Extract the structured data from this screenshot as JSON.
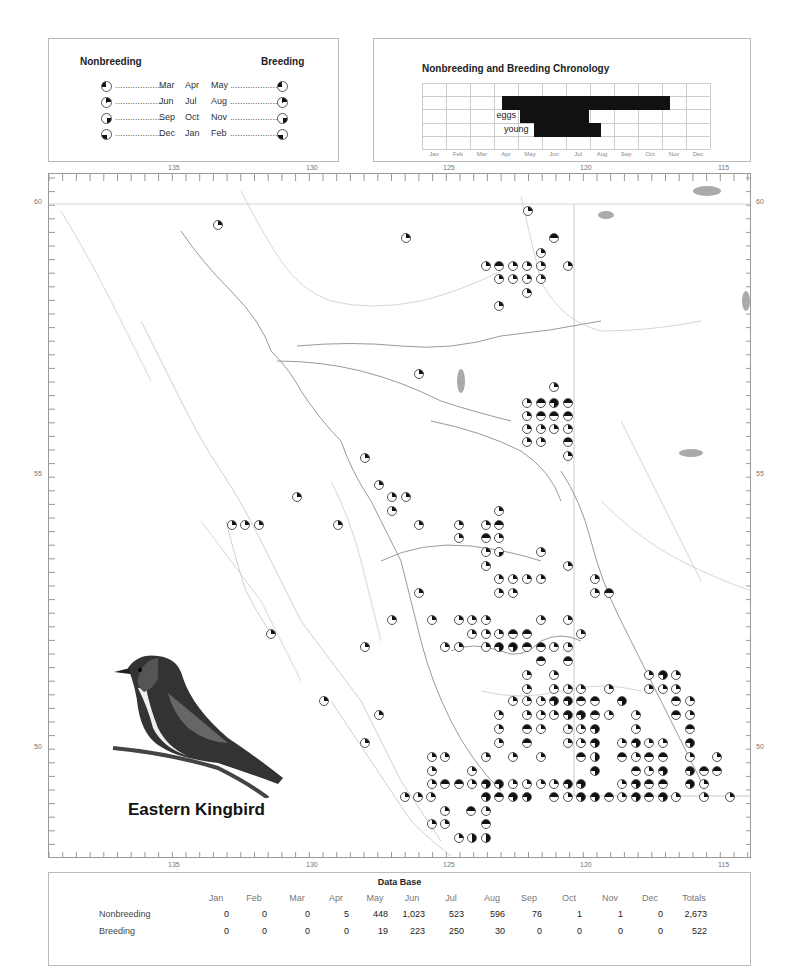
{
  "legend": {
    "nonbreeding_label": "Nonbreeding",
    "breeding_label": "Breeding",
    "rows": [
      {
        "left": "Mar",
        "mid": "Apr",
        "right": "May",
        "quarter": "q1"
      },
      {
        "left": "Jun",
        "mid": "Jul",
        "right": "Aug",
        "quarter": "q2"
      },
      {
        "left": "Sep",
        "mid": "Oct",
        "right": "Nov",
        "quarter": "q3"
      },
      {
        "left": "Dec",
        "mid": "Jan",
        "right": "Feb",
        "quarter": "q4"
      }
    ],
    "dots": "....................",
    "dots_right": "....................."
  },
  "chronology": {
    "title": "Nonbreeding and Breeding Chronology",
    "months": [
      "Jan",
      "Feb",
      "Mar",
      "Apr",
      "May",
      "Jun",
      "Jul",
      "Aug",
      "Sep",
      "Oct",
      "Nov",
      "Dec"
    ],
    "bars": [
      {
        "label": "",
        "start": 3.33,
        "end": 10.33
      },
      {
        "label": "eggs",
        "start": 4.1,
        "end": 6.95
      },
      {
        "label": "young",
        "start": 4.65,
        "end": 7.45
      }
    ]
  },
  "map": {
    "longitude_labels": [
      {
        "v": "135",
        "x": 174
      },
      {
        "v": "130",
        "x": 312
      },
      {
        "v": "125",
        "x": 449
      },
      {
        "v": "120",
        "x": 586
      },
      {
        "v": "115",
        "x": 724
      }
    ],
    "latitude_labels": [
      {
        "v": "60",
        "y": 203
      },
      {
        "v": "55",
        "y": 475
      },
      {
        "v": "50",
        "y": 748
      }
    ],
    "fill_color": "#111111",
    "symbols": [
      {
        "x": 217,
        "y": 224,
        "t": "q2"
      },
      {
        "x": 527,
        "y": 210,
        "t": "q2"
      },
      {
        "x": 405,
        "y": 237,
        "t": "q2"
      },
      {
        "x": 553,
        "y": 237,
        "t": "half"
      },
      {
        "x": 540,
        "y": 252,
        "t": "q2"
      },
      {
        "x": 485,
        "y": 265,
        "t": "q2"
      },
      {
        "x": 498,
        "y": 265,
        "t": "half"
      },
      {
        "x": 512,
        "y": 265,
        "t": "q2"
      },
      {
        "x": 526,
        "y": 265,
        "t": "q2"
      },
      {
        "x": 540,
        "y": 265,
        "t": "q2"
      },
      {
        "x": 567,
        "y": 265,
        "t": "q2"
      },
      {
        "x": 498,
        "y": 278,
        "t": "q2"
      },
      {
        "x": 512,
        "y": 278,
        "t": "q2"
      },
      {
        "x": 526,
        "y": 278,
        "t": "q2"
      },
      {
        "x": 540,
        "y": 278,
        "t": "q2"
      },
      {
        "x": 526,
        "y": 292,
        "t": "q2"
      },
      {
        "x": 498,
        "y": 305,
        "t": "q2"
      },
      {
        "x": 418,
        "y": 373,
        "t": "q2"
      },
      {
        "x": 553,
        "y": 386,
        "t": "q2"
      },
      {
        "x": 526,
        "y": 402,
        "t": "q2"
      },
      {
        "x": 540,
        "y": 402,
        "t": "half"
      },
      {
        "x": 553,
        "y": 402,
        "t": "3q"
      },
      {
        "x": 567,
        "y": 402,
        "t": "half"
      },
      {
        "x": 526,
        "y": 415,
        "t": "q2"
      },
      {
        "x": 540,
        "y": 415,
        "t": "half"
      },
      {
        "x": 553,
        "y": 415,
        "t": "half"
      },
      {
        "x": 567,
        "y": 415,
        "t": "half"
      },
      {
        "x": 526,
        "y": 428,
        "t": "q2"
      },
      {
        "x": 540,
        "y": 428,
        "t": "q2"
      },
      {
        "x": 553,
        "y": 428,
        "t": "q2"
      },
      {
        "x": 567,
        "y": 428,
        "t": "q2"
      },
      {
        "x": 526,
        "y": 441,
        "t": "q2"
      },
      {
        "x": 540,
        "y": 441,
        "t": "q2"
      },
      {
        "x": 567,
        "y": 441,
        "t": "half"
      },
      {
        "x": 567,
        "y": 455,
        "t": "q2"
      },
      {
        "x": 364,
        "y": 457,
        "t": "q2"
      },
      {
        "x": 296,
        "y": 496,
        "t": "q2"
      },
      {
        "x": 378,
        "y": 484,
        "t": "q2"
      },
      {
        "x": 391,
        "y": 496,
        "t": "q2"
      },
      {
        "x": 405,
        "y": 496,
        "t": "q2"
      },
      {
        "x": 391,
        "y": 510,
        "t": "q2"
      },
      {
        "x": 498,
        "y": 510,
        "t": "q2"
      },
      {
        "x": 231,
        "y": 524,
        "t": "q2"
      },
      {
        "x": 244,
        "y": 524,
        "t": "q2"
      },
      {
        "x": 258,
        "y": 524,
        "t": "q2"
      },
      {
        "x": 337,
        "y": 524,
        "t": "q2"
      },
      {
        "x": 418,
        "y": 524,
        "t": "q2"
      },
      {
        "x": 458,
        "y": 524,
        "t": "q2"
      },
      {
        "x": 485,
        "y": 524,
        "t": "q2"
      },
      {
        "x": 498,
        "y": 524,
        "t": "half"
      },
      {
        "x": 458,
        "y": 537,
        "t": "q2"
      },
      {
        "x": 485,
        "y": 537,
        "t": "half"
      },
      {
        "x": 498,
        "y": 537,
        "t": "q2"
      },
      {
        "x": 485,
        "y": 551,
        "t": "q2"
      },
      {
        "x": 498,
        "y": 551,
        "t": "q3"
      },
      {
        "x": 540,
        "y": 551,
        "t": "q2"
      },
      {
        "x": 485,
        "y": 565,
        "t": "q2"
      },
      {
        "x": 567,
        "y": 565,
        "t": "q2"
      },
      {
        "x": 498,
        "y": 578,
        "t": "q2"
      },
      {
        "x": 512,
        "y": 578,
        "t": "q2"
      },
      {
        "x": 526,
        "y": 578,
        "t": "q2"
      },
      {
        "x": 540,
        "y": 578,
        "t": "q2"
      },
      {
        "x": 594,
        "y": 578,
        "t": "q2"
      },
      {
        "x": 498,
        "y": 592,
        "t": "q2"
      },
      {
        "x": 512,
        "y": 592,
        "t": "q2"
      },
      {
        "x": 594,
        "y": 592,
        "t": "q2"
      },
      {
        "x": 608,
        "y": 592,
        "t": "half"
      },
      {
        "x": 418,
        "y": 592,
        "t": "q2"
      },
      {
        "x": 391,
        "y": 619,
        "t": "q2"
      },
      {
        "x": 270,
        "y": 633,
        "t": "q2"
      },
      {
        "x": 364,
        "y": 646,
        "t": "q2"
      },
      {
        "x": 431,
        "y": 619,
        "t": "q2"
      },
      {
        "x": 458,
        "y": 619,
        "t": "q2"
      },
      {
        "x": 471,
        "y": 619,
        "t": "q2"
      },
      {
        "x": 485,
        "y": 619,
        "t": "q2"
      },
      {
        "x": 540,
        "y": 619,
        "t": "q2"
      },
      {
        "x": 567,
        "y": 619,
        "t": "q2"
      },
      {
        "x": 471,
        "y": 633,
        "t": "q2"
      },
      {
        "x": 485,
        "y": 633,
        "t": "q2"
      },
      {
        "x": 498,
        "y": 633,
        "t": "q2"
      },
      {
        "x": 512,
        "y": 633,
        "t": "half"
      },
      {
        "x": 526,
        "y": 633,
        "t": "half"
      },
      {
        "x": 580,
        "y": 633,
        "t": "q2"
      },
      {
        "x": 444,
        "y": 646,
        "t": "q2"
      },
      {
        "x": 458,
        "y": 646,
        "t": "q2"
      },
      {
        "x": 485,
        "y": 646,
        "t": "q2"
      },
      {
        "x": 498,
        "y": 646,
        "t": "3q"
      },
      {
        "x": 512,
        "y": 646,
        "t": "3q"
      },
      {
        "x": 526,
        "y": 646,
        "t": "half"
      },
      {
        "x": 540,
        "y": 646,
        "t": "half"
      },
      {
        "x": 553,
        "y": 646,
        "t": "q2"
      },
      {
        "x": 567,
        "y": 646,
        "t": "q2"
      },
      {
        "x": 540,
        "y": 660,
        "t": "half"
      },
      {
        "x": 567,
        "y": 660,
        "t": "half"
      },
      {
        "x": 526,
        "y": 674,
        "t": "q2"
      },
      {
        "x": 553,
        "y": 674,
        "t": "q2"
      },
      {
        "x": 648,
        "y": 674,
        "t": "q2"
      },
      {
        "x": 662,
        "y": 674,
        "t": "3q"
      },
      {
        "x": 675,
        "y": 674,
        "t": "q2"
      },
      {
        "x": 526,
        "y": 688,
        "t": "q2"
      },
      {
        "x": 553,
        "y": 688,
        "t": "q2"
      },
      {
        "x": 567,
        "y": 688,
        "t": "q2"
      },
      {
        "x": 580,
        "y": 688,
        "t": "q2"
      },
      {
        "x": 608,
        "y": 688,
        "t": "q2"
      },
      {
        "x": 648,
        "y": 688,
        "t": "q2"
      },
      {
        "x": 662,
        "y": 688,
        "t": "q2"
      },
      {
        "x": 675,
        "y": 688,
        "t": "q2"
      },
      {
        "x": 323,
        "y": 700,
        "t": "q2"
      },
      {
        "x": 512,
        "y": 700,
        "t": "q2"
      },
      {
        "x": 526,
        "y": 700,
        "t": "q2"
      },
      {
        "x": 540,
        "y": 700,
        "t": "q2"
      },
      {
        "x": 553,
        "y": 700,
        "t": "3q"
      },
      {
        "x": 567,
        "y": 700,
        "t": "3q"
      },
      {
        "x": 580,
        "y": 700,
        "t": "half"
      },
      {
        "x": 594,
        "y": 700,
        "t": "half"
      },
      {
        "x": 621,
        "y": 700,
        "t": "3q"
      },
      {
        "x": 675,
        "y": 700,
        "t": "half"
      },
      {
        "x": 689,
        "y": 700,
        "t": "q2"
      },
      {
        "x": 498,
        "y": 714,
        "t": "q2"
      },
      {
        "x": 526,
        "y": 714,
        "t": "q2"
      },
      {
        "x": 540,
        "y": 714,
        "t": "q2"
      },
      {
        "x": 553,
        "y": 714,
        "t": "q2"
      },
      {
        "x": 567,
        "y": 714,
        "t": "3q"
      },
      {
        "x": 580,
        "y": 714,
        "t": "3q"
      },
      {
        "x": 594,
        "y": 714,
        "t": "half"
      },
      {
        "x": 608,
        "y": 714,
        "t": "q2"
      },
      {
        "x": 635,
        "y": 714,
        "t": "q2"
      },
      {
        "x": 675,
        "y": 714,
        "t": "half"
      },
      {
        "x": 689,
        "y": 714,
        "t": "q2"
      },
      {
        "x": 378,
        "y": 714,
        "t": "q2"
      },
      {
        "x": 498,
        "y": 728,
        "t": "q2"
      },
      {
        "x": 526,
        "y": 728,
        "t": "half"
      },
      {
        "x": 540,
        "y": 728,
        "t": "q2"
      },
      {
        "x": 567,
        "y": 728,
        "t": "q2"
      },
      {
        "x": 580,
        "y": 728,
        "t": "q2"
      },
      {
        "x": 594,
        "y": 728,
        "t": "3q"
      },
      {
        "x": 635,
        "y": 728,
        "t": "q2"
      },
      {
        "x": 689,
        "y": 728,
        "t": "half"
      },
      {
        "x": 498,
        "y": 742,
        "t": "q2"
      },
      {
        "x": 526,
        "y": 742,
        "t": "half"
      },
      {
        "x": 567,
        "y": 742,
        "t": "q2"
      },
      {
        "x": 580,
        "y": 742,
        "t": "q2"
      },
      {
        "x": 594,
        "y": 742,
        "t": "3q"
      },
      {
        "x": 621,
        "y": 742,
        "t": "q2"
      },
      {
        "x": 635,
        "y": 742,
        "t": "3q"
      },
      {
        "x": 648,
        "y": 742,
        "t": "q2"
      },
      {
        "x": 662,
        "y": 742,
        "t": "q2"
      },
      {
        "x": 689,
        "y": 742,
        "t": "3q"
      },
      {
        "x": 364,
        "y": 742,
        "t": "q2"
      },
      {
        "x": 431,
        "y": 756,
        "t": "q2"
      },
      {
        "x": 444,
        "y": 756,
        "t": "q2"
      },
      {
        "x": 485,
        "y": 756,
        "t": "q2"
      },
      {
        "x": 512,
        "y": 756,
        "t": "q2"
      },
      {
        "x": 540,
        "y": 756,
        "t": "q2"
      },
      {
        "x": 580,
        "y": 756,
        "t": "half"
      },
      {
        "x": 594,
        "y": 756,
        "t": "vhalf"
      },
      {
        "x": 621,
        "y": 756,
        "t": "half"
      },
      {
        "x": 635,
        "y": 756,
        "t": "q2"
      },
      {
        "x": 648,
        "y": 756,
        "t": "half"
      },
      {
        "x": 662,
        "y": 756,
        "t": "half"
      },
      {
        "x": 689,
        "y": 756,
        "t": "q2"
      },
      {
        "x": 716,
        "y": 756,
        "t": "q2"
      },
      {
        "x": 431,
        "y": 770,
        "t": "q2"
      },
      {
        "x": 471,
        "y": 770,
        "t": "q2"
      },
      {
        "x": 594,
        "y": 770,
        "t": "3q"
      },
      {
        "x": 635,
        "y": 770,
        "t": "half"
      },
      {
        "x": 648,
        "y": 770,
        "t": "q2"
      },
      {
        "x": 662,
        "y": 770,
        "t": "3q"
      },
      {
        "x": 689,
        "y": 770,
        "t": "3q"
      },
      {
        "x": 703,
        "y": 770,
        "t": "half"
      },
      {
        "x": 716,
        "y": 770,
        "t": "half"
      },
      {
        "x": 431,
        "y": 783,
        "t": "q2"
      },
      {
        "x": 444,
        "y": 783,
        "t": "half"
      },
      {
        "x": 458,
        "y": 783,
        "t": "half"
      },
      {
        "x": 471,
        "y": 783,
        "t": "q2"
      },
      {
        "x": 485,
        "y": 783,
        "t": "3q"
      },
      {
        "x": 498,
        "y": 783,
        "t": "3q"
      },
      {
        "x": 512,
        "y": 783,
        "t": "q2"
      },
      {
        "x": 526,
        "y": 783,
        "t": "q2"
      },
      {
        "x": 540,
        "y": 783,
        "t": "q2"
      },
      {
        "x": 553,
        "y": 783,
        "t": "q2"
      },
      {
        "x": 567,
        "y": 783,
        "t": "3q"
      },
      {
        "x": 580,
        "y": 783,
        "t": "3q"
      },
      {
        "x": 621,
        "y": 783,
        "t": "q2"
      },
      {
        "x": 635,
        "y": 783,
        "t": "3q"
      },
      {
        "x": 648,
        "y": 783,
        "t": "half"
      },
      {
        "x": 662,
        "y": 783,
        "t": "half"
      },
      {
        "x": 689,
        "y": 783,
        "t": "3q"
      },
      {
        "x": 703,
        "y": 783,
        "t": "q2"
      },
      {
        "x": 404,
        "y": 796,
        "t": "q2"
      },
      {
        "x": 417,
        "y": 796,
        "t": "q2"
      },
      {
        "x": 430,
        "y": 796,
        "t": "q2"
      },
      {
        "x": 485,
        "y": 796,
        "t": "3q"
      },
      {
        "x": 498,
        "y": 796,
        "t": "half"
      },
      {
        "x": 512,
        "y": 796,
        "t": "3q"
      },
      {
        "x": 526,
        "y": 796,
        "t": "3q"
      },
      {
        "x": 553,
        "y": 796,
        "t": "half"
      },
      {
        "x": 567,
        "y": 796,
        "t": "q2"
      },
      {
        "x": 580,
        "y": 796,
        "t": "3q"
      },
      {
        "x": 594,
        "y": 796,
        "t": "3q"
      },
      {
        "x": 608,
        "y": 796,
        "t": "half"
      },
      {
        "x": 621,
        "y": 796,
        "t": "q2"
      },
      {
        "x": 635,
        "y": 796,
        "t": "3q"
      },
      {
        "x": 648,
        "y": 796,
        "t": "half"
      },
      {
        "x": 662,
        "y": 796,
        "t": "3q"
      },
      {
        "x": 675,
        "y": 796,
        "t": "q2"
      },
      {
        "x": 703,
        "y": 796,
        "t": "q2"
      },
      {
        "x": 729,
        "y": 796,
        "t": "q2"
      },
      {
        "x": 444,
        "y": 810,
        "t": "q2"
      },
      {
        "x": 470,
        "y": 810,
        "t": "half"
      },
      {
        "x": 485,
        "y": 810,
        "t": "q2"
      },
      {
        "x": 431,
        "y": 823,
        "t": "q2"
      },
      {
        "x": 444,
        "y": 823,
        "t": "q2"
      },
      {
        "x": 485,
        "y": 823,
        "t": "half"
      },
      {
        "x": 458,
        "y": 837,
        "t": "q2"
      },
      {
        "x": 471,
        "y": 837,
        "t": "vhalf"
      },
      {
        "x": 485,
        "y": 837,
        "t": "vhalf"
      }
    ]
  },
  "species": {
    "name": "Eastern Kingbird"
  },
  "database": {
    "title": "Data Base",
    "months": [
      "Jan",
      "Feb",
      "Mar",
      "Apr",
      "May",
      "Jun",
      "Jul",
      "Aug",
      "Sep",
      "Oct",
      "Nov",
      "Dec"
    ],
    "totals_label": "Totals",
    "rows": [
      {
        "label": "Nonbreeding",
        "values": [
          "0",
          "0",
          "0",
          "5",
          "448",
          "1,023",
          "523",
          "596",
          "76",
          "1",
          "1",
          "0"
        ],
        "total": "2,673"
      },
      {
        "label": "Breeding",
        "values": [
          "0",
          "0",
          "0",
          "0",
          "19",
          "223",
          "250",
          "30",
          "0",
          "0",
          "0",
          "0"
        ],
        "total": "522"
      }
    ]
  }
}
